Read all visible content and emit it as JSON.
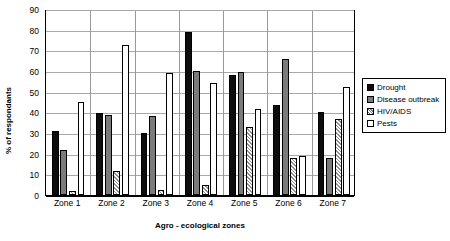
{
  "chart_data": {
    "type": "bar",
    "title": "",
    "xlabel": "Agro - ecological zones",
    "ylabel": "% of respondants",
    "categories": [
      "Zone 1",
      "Zone 2",
      "Zone 3",
      "Zone 4",
      "Zone 5",
      "Zone 6",
      "Zone 7"
    ],
    "series": [
      {
        "name": "Drought",
        "style": "solid-black",
        "values": [
          31,
          39.5,
          30,
          79,
          58,
          43.5,
          40
        ]
      },
      {
        "name": "Disease outbreak",
        "style": "solid-gray",
        "values": [
          22,
          38.5,
          38,
          60,
          59.5,
          66,
          18
        ]
      },
      {
        "name": "HIV/AIDS",
        "style": "hatched-white",
        "values": [
          2,
          11.5,
          2.5,
          5,
          33,
          18,
          37
        ]
      },
      {
        "name": "Pests",
        "style": "open-white",
        "values": [
          45,
          72.5,
          59,
          54,
          41.5,
          19,
          52.5
        ]
      }
    ],
    "ylim": [
      0,
      90
    ],
    "ytick_step": 10,
    "yticks": [
      0,
      10,
      20,
      30,
      40,
      50,
      60,
      70,
      80,
      90
    ],
    "grid": "horizontal",
    "legend_position": "right",
    "legend_entries": [
      "Drought",
      "Disease outbreak",
      "HIV/AIDS",
      "Pests"
    ],
    "colors": {
      "drought": "#0d0d0d",
      "disease_outbreak": "#7b7b7b",
      "hiv_aids": "#ffffff",
      "pests": "#ffffff",
      "gridline": "#a8a8a8",
      "axis": "#000000",
      "background": "#ffffff"
    }
  }
}
